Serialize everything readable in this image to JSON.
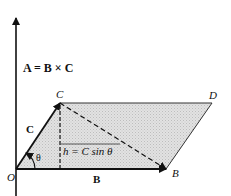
{
  "diagram": {
    "type": "vector-cross-product-parallelogram",
    "equation": "A = B × C",
    "points": {
      "O": "O",
      "B": "B",
      "C": "C",
      "D": "D"
    },
    "vectors": {
      "A": "A",
      "B": "B",
      "C": "C"
    },
    "height_label": "h = C sin θ",
    "angle_label": "θ",
    "colors": {
      "line": "#111111",
      "fill": "#d9d9d9",
      "background": "#ffffff"
    }
  }
}
